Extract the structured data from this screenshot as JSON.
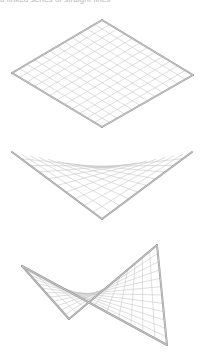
{
  "caption": "a linked series of straight lines",
  "colors": {
    "frame": "#9a9a9a",
    "grid": "#c8c8c8",
    "background": "#ffffff"
  },
  "figures": [
    {
      "name": "flat-plane",
      "divisions": 12,
      "corners": {
        "a": [
          102,
          20
        ],
        "b": [
          193,
          75
        ],
        "c": [
          102,
          127
        ],
        "d": [
          12,
          73
        ]
      },
      "frame_edges": [
        [
          "a",
          "b"
        ],
        [
          "b",
          "c"
        ],
        [
          "c",
          "d"
        ],
        [
          "d",
          "a"
        ]
      ]
    },
    {
      "name": "hypar-side-view",
      "divisions": 10,
      "corners": {
        "a": [
          12,
          152
        ],
        "b": [
          102,
          170
        ],
        "c": [
          192,
          152
        ],
        "d": [
          102,
          219
        ]
      },
      "frame_edges": [
        [
          "a",
          "d"
        ],
        [
          "d",
          "c"
        ]
      ]
    },
    {
      "name": "hypar-perspective",
      "divisions": 12,
      "corners": {
        "a": [
          22,
          266
        ],
        "b": [
          69,
          319
        ],
        "c": [
          157,
          245
        ],
        "d": [
          167,
          345
        ]
      },
      "frame_edges": [
        [
          "a",
          "b"
        ],
        [
          "b",
          "c"
        ],
        [
          "c",
          "d"
        ],
        [
          "d",
          "a"
        ]
      ]
    }
  ]
}
